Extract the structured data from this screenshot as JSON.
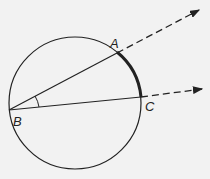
{
  "diagram": {
    "colors": {
      "background": "#f2f2f2",
      "stroke": "#222222"
    },
    "circle": {
      "cx": 75,
      "cy": 103,
      "r": 66
    },
    "points": {
      "A": {
        "label": "A",
        "x": 117,
        "y": 53
      },
      "B": {
        "label": "B",
        "x": 9,
        "y": 110
      },
      "C": {
        "label": "C",
        "x": 141,
        "y": 97
      }
    },
    "rays": [
      {
        "name": "ray-BA",
        "from": "B",
        "through": "A",
        "end": [
          200,
          9
        ],
        "style": "solid-then-dashed"
      },
      {
        "name": "ray-BC",
        "from": "B",
        "through": "C",
        "end": [
          203,
          88
        ],
        "style": "solid-then-dashed"
      }
    ],
    "highlighted_arc": {
      "from": "A",
      "to": "C",
      "style": "thick"
    },
    "angle_marker": {
      "vertex": "B",
      "radius": 30
    }
  }
}
